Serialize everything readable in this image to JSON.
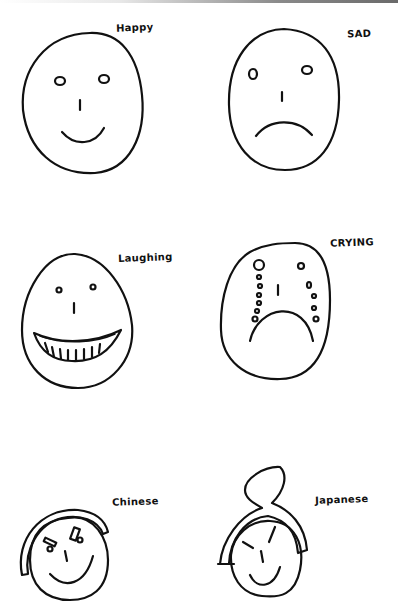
{
  "stroke_color": "#111111",
  "paper_color": "#ffffff",
  "faces": [
    {
      "id": "happy",
      "label": "Happy"
    },
    {
      "id": "sad",
      "label": "SAD"
    },
    {
      "id": "laughing",
      "label": "Laughing"
    },
    {
      "id": "crying",
      "label": "CRYING"
    },
    {
      "id": "chinese",
      "label": "Chinese"
    },
    {
      "id": "japanese",
      "label": "Japanese"
    }
  ]
}
